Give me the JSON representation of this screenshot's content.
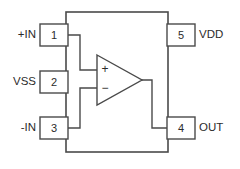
{
  "diagram": {
    "type": "op-amp-pinout",
    "colors": {
      "line": "#4a4a4a",
      "text": "#2b2b2b",
      "background": "#ffffff"
    },
    "package": {
      "name": "ic-package-outline",
      "x": 66,
      "y": 12,
      "width": 102,
      "height": 140
    },
    "amplifier": {
      "symbol": "triangle",
      "apex_x": 142,
      "left_x": 97,
      "top_y": 55,
      "bottom_y": 105,
      "noninverting_marker": "+",
      "inverting_marker": "−"
    },
    "pins": [
      {
        "number": "1",
        "label": "+IN",
        "side": "left",
        "box": {
          "x": 40,
          "y": 24,
          "width": 28,
          "height": 22
        },
        "label_x": 36,
        "label_y": 35
      },
      {
        "number": "2",
        "label": "VSS",
        "side": "left",
        "box": {
          "x": 40,
          "y": 71,
          "width": 28,
          "height": 22
        },
        "label_x": 36,
        "label_y": 82
      },
      {
        "number": "3",
        "label": "-IN",
        "side": "left",
        "box": {
          "x": 40,
          "y": 117,
          "width": 28,
          "height": 22
        },
        "label_x": 36,
        "label_y": 128
      },
      {
        "number": "5",
        "label": "VDD",
        "side": "right",
        "box": {
          "x": 167,
          "y": 24,
          "width": 28,
          "height": 22
        },
        "label_x": 199,
        "label_y": 35
      },
      {
        "number": "4",
        "label": "OUT",
        "side": "right",
        "box": {
          "x": 167,
          "y": 117,
          "width": 28,
          "height": 22
        },
        "label_x": 199,
        "label_y": 128
      }
    ],
    "wires": {
      "pin1_to_noninverting": "M68,35 L80,35 L80,70 L97,70",
      "pin3_to_inverting": "M68,128 L80,128 L80,88 L97,88",
      "output_to_pin4": "M142,80 L152,80 L152,128 L167,128"
    }
  }
}
